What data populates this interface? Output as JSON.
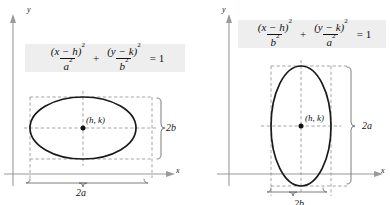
{
  "figure": {
    "background_color": "#ffffff",
    "formula_band_color": "#eeeeee",
    "curve_color": "#1a1a1a",
    "guide_color": "#8a8a8a"
  },
  "panels": [
    {
      "id": "horizontal-major-axis",
      "equation": {
        "term1": {
          "numerator": "(x − h)",
          "numerator_exponent": "2",
          "denominator": "a",
          "denominator_exponent": "2"
        },
        "operator": "+",
        "term2": {
          "numerator": "(y − k)",
          "numerator_exponent": "2",
          "denominator": "b",
          "denominator_exponent": "2"
        },
        "equals": "= 1",
        "plain": "(x − h)²/a² + (y − k)²/b² = 1"
      },
      "axis_labels": {
        "y": "y",
        "x": "x"
      },
      "center_label": "(h, k)",
      "measure_vertical": "2b",
      "measure_horizontal": "2a",
      "geometry": {
        "origin": {
          "x": 13,
          "y": 174
        },
        "center": {
          "x": 83,
          "y": 128
        },
        "semi_axis_x": 53,
        "semi_axis_y": 31,
        "orientation": "horizontal"
      }
    },
    {
      "id": "vertical-major-axis",
      "equation": {
        "term1": {
          "numerator": "(x − h)",
          "numerator_exponent": "2",
          "denominator": "b",
          "denominator_exponent": "2"
        },
        "operator": "+",
        "term2": {
          "numerator": "(y − k)",
          "numerator_exponent": "2",
          "denominator": "a",
          "denominator_exponent": "2"
        },
        "equals": "= 1",
        "plain": "(x − h)²/b² + (y − k)²/a² = 1"
      },
      "axis_labels": {
        "y": "y",
        "x": "x"
      },
      "center_label": "(h, k)",
      "measure_vertical": "2a",
      "measure_horizontal": "2b",
      "geometry": {
        "origin": {
          "x": 34,
          "y": 174
        },
        "center": {
          "x": 106,
          "y": 126
        },
        "semi_axis_x": 30,
        "semi_axis_y": 60,
        "orientation": "vertical"
      }
    }
  ]
}
